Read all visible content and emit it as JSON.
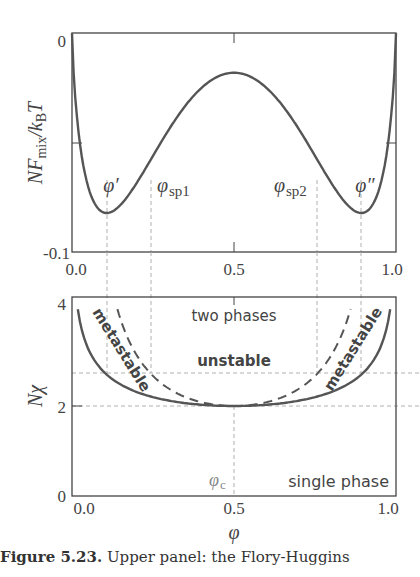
{
  "chart_data": [
    {
      "type": "line",
      "panel": "upper",
      "title": "",
      "xlabel": "",
      "ylabel": "N F_mix / k_B T",
      "xlim": [
        0.0,
        1.0
      ],
      "ylim": [
        -0.1,
        0
      ],
      "x_ticks": [
        "0.0",
        "0.5",
        "1.0"
      ],
      "y_ticks": [
        "0",
        "-0.1"
      ],
      "grid": false,
      "model": {
        "Nchi": 2.7,
        "formula": "phi ln phi + (1-phi) ln(1-phi) + Nchi phi (1-phi)"
      },
      "series": [
        {
          "name": "NF_mix/kBT",
          "x": [
            0.0,
            0.02,
            0.05,
            0.1,
            0.15,
            0.2,
            0.245,
            0.3,
            0.4,
            0.5,
            0.6,
            0.7,
            0.755,
            0.8,
            0.85,
            0.9,
            0.95,
            0.98,
            1.0
          ],
          "values": [
            0.0,
            -0.045,
            -0.07,
            -0.082,
            -0.078,
            -0.069,
            -0.059,
            -0.046,
            -0.025,
            -0.018,
            -0.025,
            -0.046,
            -0.059,
            -0.069,
            -0.078,
            -0.082,
            -0.07,
            -0.045,
            0.0
          ]
        }
      ],
      "annotations": [
        {
          "text": "φ′",
          "x": 0.108,
          "kind": "binodal"
        },
        {
          "text": "φsp1",
          "x": 0.245,
          "kind": "spinodal"
        },
        {
          "text": "φsp2",
          "x": 0.755,
          "kind": "spinodal"
        },
        {
          "text": "φ″",
          "x": 0.892,
          "kind": "binodal"
        }
      ]
    },
    {
      "type": "line",
      "panel": "lower",
      "title": "",
      "xlabel": "φ",
      "ylabel": "Nχ",
      "xlim": [
        0.0,
        1.0
      ],
      "ylim": [
        0,
        4.4
      ],
      "x_ticks": [
        "0.0",
        "0.5",
        "1.0"
      ],
      "y_ticks": [
        "0",
        "2",
        "4"
      ],
      "grid": false,
      "reference_lines": {
        "horizontal": [
          2.0,
          2.7
        ],
        "vertical": [
          0.108,
          0.245,
          0.5,
          0.755,
          0.892
        ]
      },
      "series": [
        {
          "name": "binodal (coexistence)",
          "style": "solid",
          "x": [
            0.02,
            0.05,
            0.1,
            0.2,
            0.3,
            0.4,
            0.5,
            0.6,
            0.7,
            0.8,
            0.9,
            0.95,
            0.98
          ],
          "values": [
            4.06,
            3.27,
            2.75,
            2.31,
            2.12,
            2.03,
            2.0,
            2.03,
            2.12,
            2.31,
            2.75,
            3.27,
            4.06
          ]
        },
        {
          "name": "spinodal",
          "style": "dashed",
          "x": [
            0.14,
            0.2,
            0.3,
            0.4,
            0.5,
            0.6,
            0.7,
            0.8,
            0.86
          ],
          "values": [
            4.15,
            3.13,
            2.38,
            2.08,
            2.0,
            2.08,
            2.38,
            3.13,
            4.15
          ]
        }
      ],
      "annotations": [
        {
          "text": "two phases"
        },
        {
          "text": "unstable"
        },
        {
          "text": "metastable",
          "side": "left"
        },
        {
          "text": "metastable",
          "side": "right"
        },
        {
          "text": "single phase"
        },
        {
          "text": "φc",
          "x": 0.5
        }
      ]
    }
  ],
  "upper": {
    "ylabel": "NF_mix/k_B T",
    "ytick_top": "0",
    "ytick_bottom": "-0.1",
    "xticks": [
      "0.0",
      "0.5",
      "1.0"
    ],
    "labels": {
      "phi_prime": "φ′",
      "phi_sp1": "φ",
      "phi_sp1_sub": "sp1",
      "phi_sp2": "φ",
      "phi_sp2_sub": "sp2",
      "phi_dprime": "φ″"
    }
  },
  "lower": {
    "ylabel_N": "N",
    "ylabel_chi": "χ",
    "yticks": [
      "4",
      "2",
      "0"
    ],
    "xticks": [
      "0.0",
      "0.5",
      "1.0"
    ],
    "xlabel": "φ",
    "region_two_phases": "two phases",
    "region_unstable": "unstable",
    "region_metastable_left": "metastable",
    "region_metastable_right": "metastable",
    "region_single_phase": "single phase",
    "phi_c": "φ",
    "phi_c_sub": "c"
  },
  "caption": {
    "number": "Figure 5.23.",
    "text": " Upper panel: the Flory-Huggins"
  },
  "colors": {
    "curve": "#555555",
    "axis": "#444444",
    "dashed": "#aaaaaa"
  }
}
